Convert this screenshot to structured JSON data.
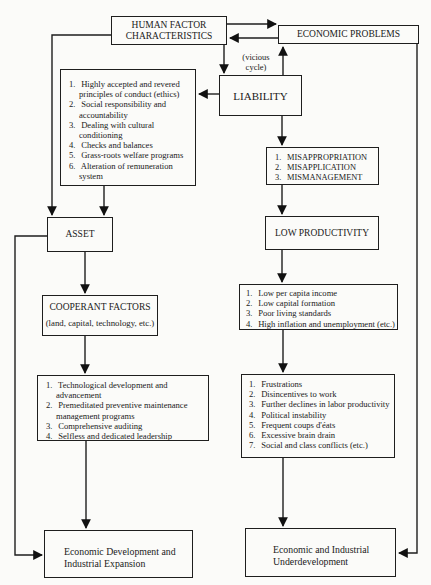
{
  "diagram": {
    "nodes": {
      "human_factor": {
        "label_line1": "HUMAN FACTOR",
        "label_line2": "CHARACTERISTICS"
      },
      "economic_problems": {
        "label": "ECONOMIC PROBLEMS"
      },
      "liability": {
        "label": "LIABILITY"
      },
      "vicious_cycle": {
        "line1": "(vicious",
        "line2": "cycle)"
      },
      "remedies": {
        "items": [
          {
            "num": "1.",
            "text": "Highly accepted and revered principles of conduct (ethics)"
          },
          {
            "num": "2.",
            "text": "Social responsibility and accountability"
          },
          {
            "num": "3.",
            "text": "Dealing with cultural conditioning"
          },
          {
            "num": "4.",
            "text": "Checks and balances"
          },
          {
            "num": "5.",
            "text": "Grass-roots welfare programs"
          },
          {
            "num": "6.",
            "text": "Alteration of remuneration system"
          }
        ]
      },
      "mis": {
        "items": [
          {
            "num": "1.",
            "text": "MISAPPROPRIATION"
          },
          {
            "num": "2.",
            "text": "MISAPPLICATION"
          },
          {
            "num": "3.",
            "text": "MISMANAGEMENT"
          }
        ]
      },
      "asset": {
        "label": "ASSET"
      },
      "low_productivity": {
        "label": "LOW PRODUCTIVITY"
      },
      "cooperant": {
        "label": "COOPERANT FACTORS",
        "sub": "(land, capital, technology, etc.)"
      },
      "low_income": {
        "items": [
          {
            "num": "1.",
            "text": "Low per capita income"
          },
          {
            "num": "2.",
            "text": "Low capital formation"
          },
          {
            "num": "3.",
            "text": "Poor living standards"
          },
          {
            "num": "4.",
            "text": "High inflation and unemployment (etc.)"
          }
        ]
      },
      "tech": {
        "items": [
          {
            "num": "1.",
            "text": "Technological development and advancement"
          },
          {
            "num": "2.",
            "text": "Premeditated preventive maintenance management programs"
          },
          {
            "num": "3.",
            "text": "Comprehensive auditing"
          },
          {
            "num": "4.",
            "text": "Selfless and dedicated leadership"
          }
        ]
      },
      "consequences": {
        "items": [
          {
            "num": "1.",
            "text": "Frustrations"
          },
          {
            "num": "2.",
            "text": "Disincentives to work"
          },
          {
            "num": "3.",
            "text": "Further declines in labor productivity"
          },
          {
            "num": "4.",
            "text": "Political instability"
          },
          {
            "num": "5.",
            "text": "Frequent coups d'éats"
          },
          {
            "num": "6.",
            "text": "Excessive brain drain"
          },
          {
            "num": "7.",
            "text": "Social and class conflicts (etc.)"
          }
        ]
      },
      "development": {
        "line1": "Economic Development and",
        "line2": "Industrial Expansion"
      },
      "underdevelopment": {
        "line1": "Economic and Industrial",
        "line2": "Underdevelopment"
      }
    }
  }
}
